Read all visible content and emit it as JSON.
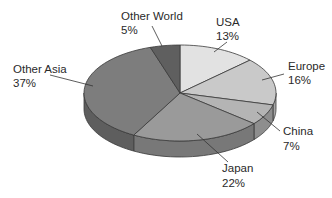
{
  "chart_data": {
    "type": "pie",
    "title": "",
    "categories": [
      "USA",
      "Europe",
      "China",
      "Japan",
      "Other Asia",
      "Other World"
    ],
    "values": [
      13,
      16,
      7,
      22,
      37,
      5
    ],
    "unit": "%",
    "labels": [
      {
        "name": "USA",
        "pct": "13%"
      },
      {
        "name": "Europe",
        "pct": "16%"
      },
      {
        "name": "China",
        "pct": "7%"
      },
      {
        "name": "Japan",
        "pct": "22%"
      },
      {
        "name": "Other Asia",
        "pct": "37%"
      },
      {
        "name": "Other World",
        "pct": "5%"
      }
    ],
    "style": "3d-pie-grayscale",
    "colors": [
      "#e2e2e2",
      "#c9c9c9",
      "#b4b4b4",
      "#9a9a9a",
      "#7d7d7d",
      "#5f5f5f"
    ],
    "side_colors": [
      "#c0c0c0",
      "#a8a8a8",
      "#8e8e8e",
      "#787878",
      "#5e5e5e",
      "#474747"
    ],
    "legend": "none (callout labels)"
  }
}
